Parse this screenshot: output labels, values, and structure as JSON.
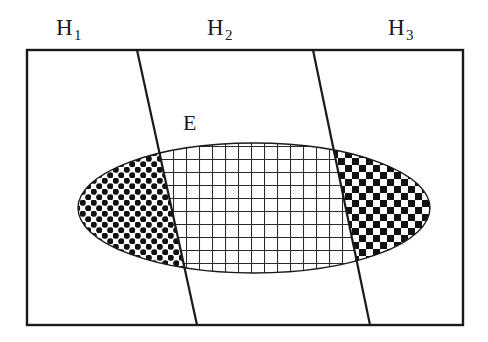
{
  "figure": {
    "type": "venn-partition-diagram",
    "background_color": "#ffffff",
    "stroke_color": "#1a1a1a"
  },
  "labels": {
    "h1": {
      "base": "H",
      "sub": "1"
    },
    "h2": {
      "base": "H",
      "sub": "2"
    },
    "h3": {
      "base": "H",
      "sub": "3"
    },
    "event": "E"
  },
  "geometry": {
    "frame": {
      "x": 27,
      "y": 50,
      "width": 436,
      "height": 275,
      "stroke_width": 2.4
    },
    "divider_lines": [
      {
        "name": "h1-h2-boundary",
        "x1": 137,
        "y1": 50,
        "x2": 197,
        "y2": 325
      },
      {
        "name": "h2-h3-boundary",
        "x1": 313,
        "y1": 50,
        "x2": 370,
        "y2": 325
      }
    ],
    "ellipse": {
      "cx": 254,
      "cy": 208,
      "rx": 176,
      "ry": 65,
      "stroke_width": 1.4
    }
  },
  "patterns": {
    "h1_region": {
      "name": "polka-dot",
      "spacing": 11,
      "dot_radius": 3.1,
      "color": "#111111"
    },
    "h2_region": {
      "name": "grid-mesh",
      "spacing": 13,
      "line_width": 2.1,
      "color": "#2b2b2b"
    },
    "h3_region": {
      "name": "checkerboard",
      "cell": 7,
      "color": "#111111"
    }
  }
}
